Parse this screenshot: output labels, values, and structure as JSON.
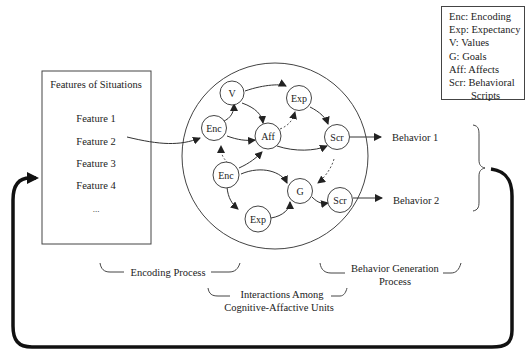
{
  "legend": {
    "items": [
      "Enc: Encoding",
      "Exp: Expectancy",
      "V: Values",
      "G: Goals",
      "Aff: Affects",
      "Scr: Behavioral",
      "Scripts"
    ]
  },
  "features_box": {
    "title": "Features of Situations",
    "items": [
      "Feature 1",
      "Feature 2",
      "Feature 3",
      "Feature 4",
      "..."
    ]
  },
  "nodes": {
    "v": "V",
    "exp_top": "Exp",
    "enc_top": "Enc",
    "aff": "Aff",
    "scr_top": "Scr",
    "enc_bottom": "Enc",
    "g": "G",
    "scr_bottom": "Scr",
    "exp_bottom": "Exp"
  },
  "behaviors": [
    "Behavior 1",
    "Behavior 2"
  ],
  "process_labels": {
    "encoding": "Encoding Process",
    "interactions_line1": "Interactions Among",
    "interactions_line2": "Cognitive-Affactive Units",
    "behavior_gen_line1": "Behavior Generation",
    "behavior_gen_line2": "Process"
  },
  "colors": {
    "stroke": "#333333",
    "feedback": "#111111",
    "background": "#ffffff"
  }
}
